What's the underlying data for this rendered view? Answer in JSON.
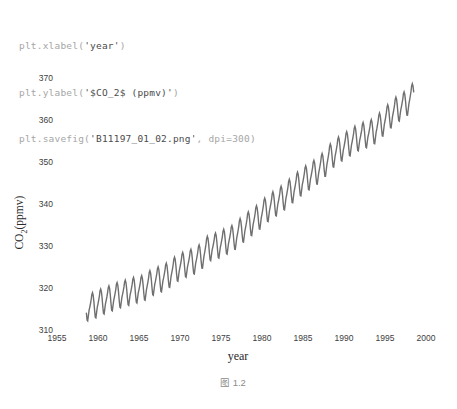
{
  "code": {
    "lines": [
      {
        "pre": "plt.xlabel(",
        "str": "'year'",
        "post": ")"
      },
      {
        "pre": "plt.ylabel(",
        "str": "'$CO_2$ (ppmv)'",
        "post": ")"
      },
      {
        "pre": "plt.savefig(",
        "str": "'B11197_01_02.png'",
        "post": ", dpi=300)"
      }
    ]
  },
  "axes": {
    "ylabel_main": "CO",
    "ylabel_sub": "2",
    "ylabel_rest": "(ppmv)"
  },
  "caption": "图 1.2",
  "chart_data": {
    "type": "line",
    "title": "",
    "xlabel": "year",
    "ylabel": "CO2 (ppmv)",
    "x_ticks": [
      1955,
      1960,
      1965,
      1970,
      1975,
      1980,
      1985,
      1990,
      1995,
      2000
    ],
    "y_ticks": [
      310,
      320,
      330,
      340,
      350,
      360,
      370
    ],
    "xlim": [
      1953,
      2001.5
    ],
    "ylim": [
      308,
      371
    ],
    "grid": false,
    "legend": false,
    "line_color": "#6f6f6f",
    "tick_color": "#404040",
    "series": [
      {
        "name": "Mauna Loa atmospheric CO2 (monthly)",
        "start_year": 1958.5833,
        "end_year": 1998.5,
        "annual_mean_years": [
          1958,
          1959,
          1960,
          1961,
          1962,
          1963,
          1964,
          1965,
          1966,
          1967,
          1968,
          1969,
          1970,
          1971,
          1972,
          1973,
          1974,
          1975,
          1976,
          1977,
          1978,
          1979,
          1980,
          1981,
          1982,
          1983,
          1984,
          1985,
          1986,
          1987,
          1988,
          1989,
          1990,
          1991,
          1992,
          1993,
          1994,
          1995,
          1996,
          1997,
          1998
        ],
        "annual_means": [
          315.34,
          315.98,
          316.91,
          317.64,
          318.45,
          318.99,
          319.62,
          320.04,
          321.37,
          322.18,
          323.05,
          324.62,
          325.68,
          326.32,
          327.46,
          329.68,
          330.19,
          331.12,
          332.03,
          333.84,
          335.41,
          336.84,
          338.76,
          340.12,
          341.48,
          343.15,
          344.87,
          346.35,
          347.61,
          349.31,
          351.69,
          353.2,
          354.45,
          355.7,
          356.54,
          357.21,
          358.96,
          360.97,
          362.74,
          363.88,
          366.0
        ],
        "seasonal_cycle_monthly": [
          -0.2,
          0.6,
          1.5,
          2.6,
          3.0,
          2.3,
          0.7,
          -1.4,
          -3.1,
          -3.3,
          -2.1,
          -0.9
        ]
      }
    ]
  }
}
